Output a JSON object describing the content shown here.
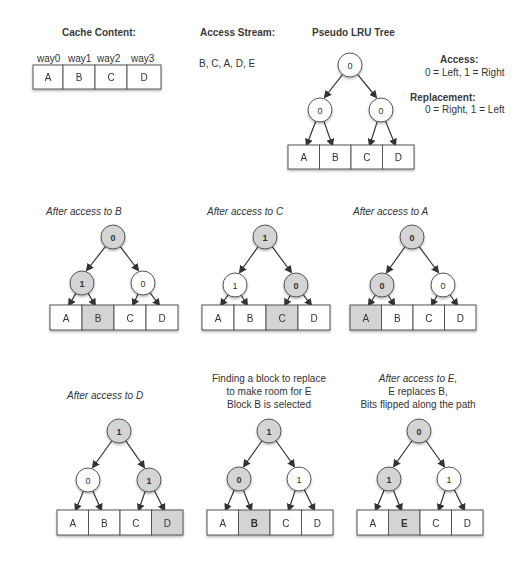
{
  "cache_content": {
    "title": "Cache Content:",
    "ways": [
      "way0",
      "way1",
      "way2",
      "way3"
    ],
    "cells": [
      "A",
      "B",
      "C",
      "D"
    ]
  },
  "access_stream": {
    "title": "Access Stream:",
    "value": "B, C, A, D, E"
  },
  "plru_tree": {
    "title": "Pseudo LRU Tree"
  },
  "legend": {
    "access_title": "Access:",
    "access_rule": "0 = Left, 1 = Right",
    "replacement_title": "Replacement:",
    "replacement_rule": "0 = Right, 1 = Left"
  },
  "colors": {
    "shaded": "#d4d4d4",
    "white": "#ffffff",
    "stroke": "#555555",
    "arrow": "#333333"
  },
  "panels": [
    {
      "id": "initial",
      "caption_lines": [],
      "caption_italic": false,
      "root": {
        "x": 350,
        "y": 65,
        "bit": "0",
        "shaded": false
      },
      "left": {
        "x": 320,
        "y": 110,
        "bit": "0",
        "shaded": false
      },
      "right": {
        "x": 381,
        "y": 110,
        "bit": "0",
        "shaded": false
      },
      "blocks": {
        "x": 288,
        "y": 145,
        "w": 126,
        "h": 24
      },
      "cells": [
        "A",
        "B",
        "C",
        "D"
      ],
      "shaded_cell": -1
    },
    {
      "id": "after-b",
      "caption_lines": [
        "After access to B"
      ],
      "caption_italic": true,
      "caption_x": 45,
      "caption_y": 203,
      "root": {
        "x": 113,
        "y": 237,
        "bit": "0",
        "shaded": true
      },
      "left": {
        "x": 82,
        "y": 283,
        "bit": "1",
        "shaded": true
      },
      "right": {
        "x": 143,
        "y": 283,
        "bit": "0",
        "shaded": false
      },
      "blocks": {
        "x": 50,
        "y": 305,
        "w": 128,
        "h": 25
      },
      "cells": [
        "A",
        "B",
        "C",
        "D"
      ],
      "shaded_cell": 1
    },
    {
      "id": "after-c",
      "caption_lines": [
        "After access to C"
      ],
      "caption_italic": true,
      "caption_x": 207,
      "caption_y": 203,
      "root": {
        "x": 265,
        "y": 237,
        "bit": "1",
        "shaded": true
      },
      "left": {
        "x": 235,
        "y": 285,
        "bit": "1",
        "shaded": false
      },
      "right": {
        "x": 296,
        "y": 285,
        "bit": "0",
        "shaded": true
      },
      "blocks": {
        "x": 202,
        "y": 305,
        "w": 128,
        "h": 25
      },
      "cells": [
        "A",
        "B",
        "C",
        "D"
      ],
      "shaded_cell": 2
    },
    {
      "id": "after-a",
      "caption_lines": [
        "After access to A"
      ],
      "caption_italic": true,
      "caption_x": 353,
      "caption_y": 203,
      "root": {
        "x": 412,
        "y": 237,
        "bit": "0",
        "shaded": true
      },
      "left": {
        "x": 382,
        "y": 285,
        "bit": "0",
        "shaded": true
      },
      "right": {
        "x": 443,
        "y": 285,
        "bit": "0",
        "shaded": false
      },
      "blocks": {
        "x": 350,
        "y": 305,
        "w": 126,
        "h": 25
      },
      "cells": [
        "A",
        "B",
        "C",
        "D"
      ],
      "shaded_cell": 0
    },
    {
      "id": "after-d",
      "caption_lines": [
        "After access to D"
      ],
      "caption_italic": true,
      "caption_x": 66,
      "caption_y": 390,
      "root": {
        "x": 119,
        "y": 431,
        "bit": "1",
        "shaded": true
      },
      "left": {
        "x": 88,
        "y": 480,
        "bit": "0",
        "shaded": false
      },
      "right": {
        "x": 149,
        "y": 480,
        "bit": "1",
        "shaded": true
      },
      "blocks": {
        "x": 57,
        "y": 510,
        "w": 126,
        "h": 25
      },
      "cells": [
        "A",
        "B",
        "C",
        "D"
      ],
      "shaded_cell": 3
    },
    {
      "id": "find-replacement",
      "caption_lines": [
        "Finding a block to replace",
        "to make room for E",
        "Block B is selected"
      ],
      "caption_italic": false,
      "caption_cx": 268,
      "caption_y": 374,
      "root": {
        "x": 269,
        "y": 431,
        "bit": "1",
        "shaded": true
      },
      "left": {
        "x": 239,
        "y": 479,
        "bit": "0",
        "shaded": true
      },
      "right": {
        "x": 299,
        "y": 479,
        "bit": "1",
        "shaded": false
      },
      "blocks": {
        "x": 207,
        "y": 510,
        "w": 126,
        "h": 25
      },
      "cells": [
        "A",
        "B",
        "C",
        "D"
      ],
      "shaded_cell": 1,
      "bold_cell": 1
    },
    {
      "id": "after-e",
      "caption_lines": [
        "After access to E,",
        "E replaces B,",
        "Bits flipped along the path"
      ],
      "caption_italic_first": true,
      "caption_cx": 418,
      "caption_y": 374,
      "root": {
        "x": 419,
        "y": 431,
        "bit": "0",
        "shaded": true
      },
      "left": {
        "x": 389,
        "y": 479,
        "bit": "1",
        "shaded": true
      },
      "right": {
        "x": 449,
        "y": 479,
        "bit": "1",
        "shaded": false
      },
      "blocks": {
        "x": 357,
        "y": 510,
        "w": 126,
        "h": 25
      },
      "cells": [
        "A",
        "E",
        "C",
        "D"
      ],
      "shaded_cell": 1,
      "bold_cell": 1
    }
  ]
}
